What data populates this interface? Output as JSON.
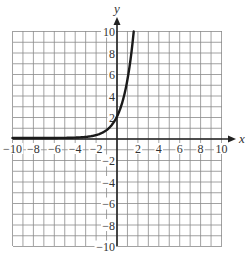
{
  "chart_data": {
    "type": "line",
    "title": "",
    "xlabel": "x",
    "ylabel": "y",
    "xlim": [
      -10,
      10
    ],
    "ylim": [
      -10,
      10
    ],
    "grid": true,
    "grid_step": 1,
    "x_tick_labels": [
      "-10",
      "-8",
      "-6",
      "-4",
      "-2",
      "2",
      "4",
      "6",
      "8",
      "10"
    ],
    "y_tick_labels": [
      "10",
      "8",
      "6",
      "4",
      "2",
      "-2",
      "-4",
      "-6",
      "-8",
      "-10"
    ],
    "series": [
      {
        "name": "exponential curve",
        "description": "Exponential growth curve approx y = 2e^x, near 0 for x < -4, crossing y-axis near 2, reaching 10 near x = 1.6",
        "x": [
          -10,
          -8,
          -6,
          -4,
          -3,
          -2,
          -1,
          -0.5,
          0,
          0.5,
          1,
          1.3,
          1.6
        ],
        "y": [
          0.0001,
          0.0007,
          0.005,
          0.04,
          0.1,
          0.27,
          0.74,
          1.21,
          2,
          3.3,
          5.44,
          7.34,
          9.9
        ]
      }
    ],
    "legend": null
  },
  "colors": {
    "grid": "#8a8a8a",
    "axis": "#222222",
    "curve": "#1a1a1a",
    "background": "#ffffff"
  }
}
